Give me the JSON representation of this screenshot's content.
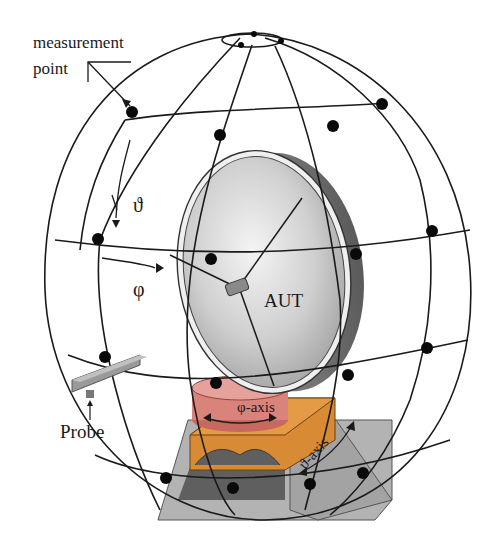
{
  "diagram": {
    "labels": {
      "measurement_point": [
        "measurement",
        "point"
      ],
      "theta": "ϑ",
      "phi": "φ",
      "aut": "AUT",
      "probe": "Probe",
      "phi_axis": "φ-axis",
      "theta_axis": "ϑ-axis"
    },
    "colors": {
      "grid_line": "#1a1a1a",
      "measurement_point": "#0a0a0a",
      "dish_light": "#e2e2e2",
      "dish_dark": "#8a8a8a",
      "phi_positioner": "#d9837a",
      "theta_positioner": "#d88b34",
      "base": "#a8a8a8",
      "base_dark": "#5f5f5f",
      "probe": "#9a9a9a"
    },
    "components": [
      {
        "name": "measurement sphere",
        "type": "wireframe sphere with latitude/longitude grid"
      },
      {
        "name": "measurement points",
        "type": "dots at grid intersections"
      },
      {
        "name": "AUT",
        "type": "parabolic dish antenna with feed"
      },
      {
        "name": "Probe",
        "type": "rectangular waveguide probe"
      },
      {
        "name": "φ-axis positioner",
        "type": "rotary stage"
      },
      {
        "name": "ϑ-axis positioner",
        "type": "rotary stage on base"
      }
    ]
  }
}
